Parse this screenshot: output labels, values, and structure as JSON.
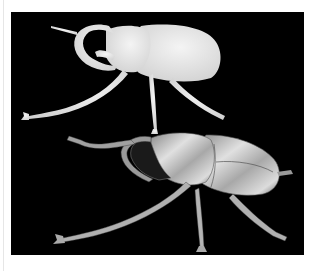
{
  "image": {
    "subject": "two beetle specimens on black background",
    "background_color": "#000000",
    "page_color": "#ffffff",
    "specimens": [
      {
        "name": "top beetle",
        "style": "white silhouette / x-ray",
        "color": "#e8e8e8"
      },
      {
        "name": "bottom beetle",
        "style": "metallic silver 3D render",
        "color": "#b8b8b8"
      }
    ]
  }
}
